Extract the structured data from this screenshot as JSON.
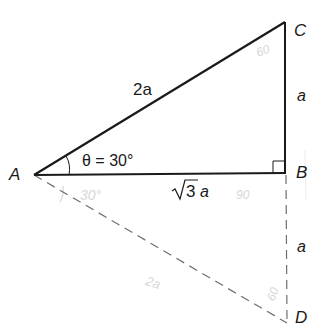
{
  "diagram": {
    "colors": {
      "solid_line": "#1a1a1a",
      "dashed_line": "#6e6e6e",
      "pencil_marks": "#d6d6d6"
    },
    "points": {
      "A": {
        "label": "A",
        "x": 34,
        "y": 175
      },
      "B": {
        "label": "B",
        "x": 285,
        "y": 173
      },
      "C": {
        "label": "C",
        "x": 285,
        "y": 22
      },
      "D": {
        "label": "D",
        "x": 287,
        "y": 323
      }
    },
    "sides": {
      "hypotenuse_AC": "2a",
      "side_BC": "a",
      "side_AB_radical": "3",
      "side_AB_suffix": "a",
      "side_BD": "a"
    },
    "angle": {
      "theta_label": "θ = 30°"
    },
    "pencil_annotations": {
      "lower_angle": "30°",
      "right_angle": "90",
      "top_angle": "60",
      "bottom_angle": "60",
      "dashed_side": "2a"
    }
  }
}
